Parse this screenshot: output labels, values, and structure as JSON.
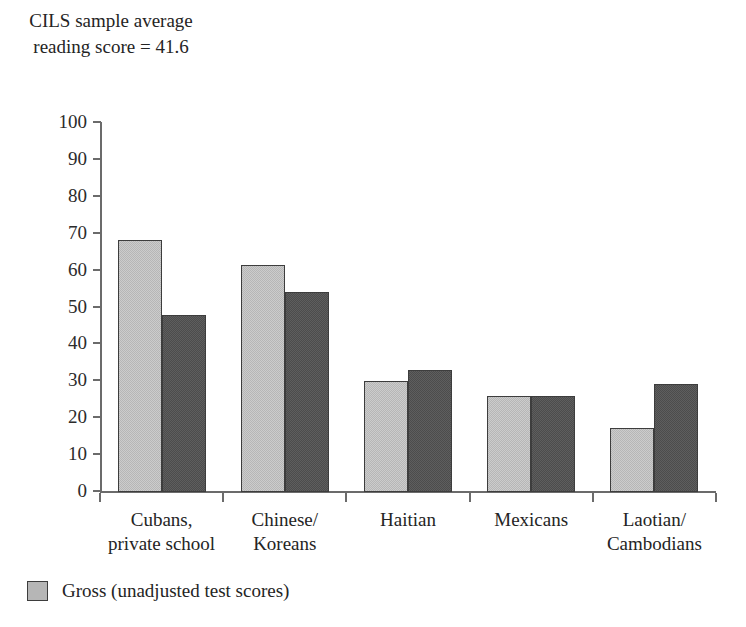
{
  "title": "CILS sample\naverage reading\nscore = 41.6",
  "chart_data": {
    "type": "bar",
    "title": "CILS sample average reading score = 41.6",
    "xlabel": "",
    "ylabel": "",
    "ylim": [
      0,
      100
    ],
    "yticks": [
      0,
      10,
      20,
      30,
      40,
      50,
      60,
      70,
      80,
      90,
      100
    ],
    "grid": false,
    "legend_position": "bottom-left",
    "categories": [
      "Cubans,\nprivate school",
      "Chinese/\nKoreans",
      "Haitian",
      "Mexicans",
      "Laotian/\nCambodians"
    ],
    "series": [
      {
        "name": "Gross (unadjusted test scores)",
        "color": "#b6b6b6",
        "values": [
          68.3,
          61.5,
          30.2,
          26.1,
          17.4
        ]
      },
      {
        "name": "",
        "color": "#4c4c4c",
        "values": [
          47.9,
          54.1,
          33.1,
          26.1,
          29.4
        ]
      }
    ]
  },
  "legend": {
    "items": [
      {
        "label": "Gross (unadjusted test scores)",
        "color": "#b6b6b6"
      }
    ]
  },
  "colors": {
    "series_light": "#b6b6b6",
    "series_dark": "#4c4c4c",
    "axis": "#6b6b6b",
    "text": "#242424",
    "background": "#ffffff"
  }
}
